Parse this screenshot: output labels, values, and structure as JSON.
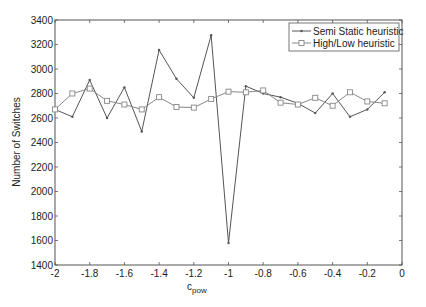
{
  "chart_data": {
    "type": "line",
    "title": "",
    "xlabel": "c",
    "xlabel_subscript": "pow",
    "ylabel": "Number of Switches",
    "xlim": [
      -2,
      0
    ],
    "ylim": [
      1400,
      3400
    ],
    "grid": false,
    "legend_position": "upper right",
    "x_ticks": [
      -2,
      -1.8,
      -1.6,
      -1.4,
      -1.2,
      -1,
      -0.8,
      -0.6,
      -0.4,
      -0.2,
      0
    ],
    "x_tick_labels": [
      "-2",
      "-1.8",
      "-1.6",
      "-1.4",
      "-1.2",
      "-1",
      "-0.8",
      "-0.6",
      "-0.4",
      "-0.2",
      "0"
    ],
    "y_ticks": [
      1400,
      1600,
      1800,
      2000,
      2200,
      2400,
      2600,
      2800,
      3000,
      3200,
      3400
    ],
    "y_tick_labels": [
      "1400",
      "1600",
      "1800",
      "2000",
      "2200",
      "2400",
      "2600",
      "2800",
      "3000",
      "3200",
      "3400"
    ],
    "x": [
      -2,
      -1.9,
      -1.8,
      -1.7,
      -1.6,
      -1.5,
      -1.4,
      -1.3,
      -1.2,
      -1.1,
      -1.0,
      -0.9,
      -0.8,
      -0.7,
      -0.6,
      -0.5,
      -0.4,
      -0.3,
      -0.2,
      -0.1
    ],
    "series": [
      {
        "name": "Semi Static heuristic",
        "marker": "dot",
        "color": "#555555",
        "values": [
          2670,
          2610,
          2910,
          2600,
          2850,
          2490,
          3155,
          2920,
          2765,
          3275,
          1580,
          2860,
          2800,
          2770,
          2720,
          2640,
          2800,
          2610,
          2670,
          2810
        ]
      },
      {
        "name": "High/Low heuristic",
        "marker": "square",
        "color": "#888888",
        "values": [
          2670,
          2800,
          2840,
          2740,
          2710,
          2670,
          2770,
          2690,
          2685,
          2755,
          2815,
          2810,
          2825,
          2725,
          2710,
          2765,
          2700,
          2810,
          2735,
          2720
        ]
      }
    ]
  }
}
